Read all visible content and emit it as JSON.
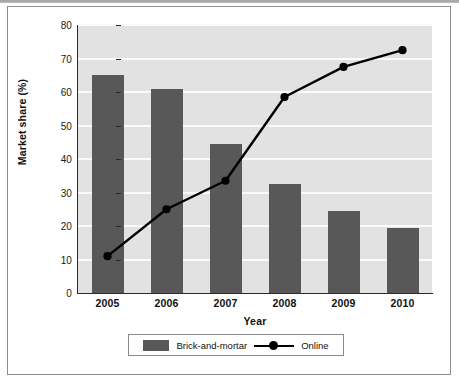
{
  "chart_data": {
    "type": "bar",
    "title": "",
    "xlabel": "Year",
    "ylabel": "Market share (%)",
    "categories": [
      "2005",
      "2006",
      "2007",
      "2008",
      "2009",
      "2010"
    ],
    "series": [
      {
        "name": "Brick-and-mortar",
        "type": "bar",
        "color": "#585858",
        "values": [
          65,
          61,
          44.5,
          32.5,
          24.5,
          19.5
        ]
      },
      {
        "name": "Online",
        "type": "line",
        "color": "#000000",
        "marker": "circle",
        "values": [
          11,
          25,
          33.5,
          58.5,
          67.5,
          72.5
        ]
      }
    ],
    "ylim": [
      0,
      80
    ],
    "yticks": [
      0,
      10,
      20,
      30,
      40,
      50,
      60,
      70,
      80
    ],
    "ytick_labels": [
      "0",
      "10",
      "20",
      "30",
      "40",
      "50",
      "60",
      "70",
      "80"
    ],
    "grid": true,
    "grid_axis": "y",
    "legend_position": "bottom",
    "plot_background": "#e2e2e2",
    "gridline_color": "#fbfbfb"
  },
  "legend": {
    "items": [
      {
        "label": "Brick-and-mortar",
        "key": "swatch"
      },
      {
        "label": "Online",
        "key": "line-marker"
      }
    ]
  },
  "axes": {
    "y_label": "Market share (%)",
    "x_label": "Year"
  }
}
